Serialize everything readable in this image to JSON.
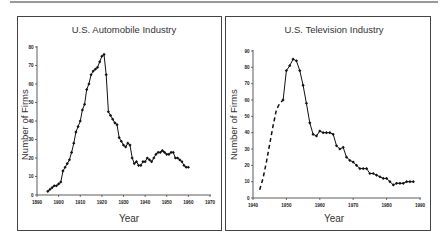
{
  "page": {
    "panels": [
      {
        "title": "U.S. Automobile Industry"
      },
      {
        "title": "U.S. Television Industry"
      }
    ]
  },
  "chart_data": [
    {
      "type": "line",
      "title": "U.S. Automobile Industry",
      "xlabel": "Year",
      "ylabel": "Number of Firms",
      "xlim": [
        1890,
        1970
      ],
      "ylim": [
        0,
        80
      ],
      "xticks": [
        1890,
        1900,
        1910,
        1920,
        1930,
        1940,
        1950,
        1960,
        1970
      ],
      "yticks": [
        0,
        10,
        20,
        30,
        40,
        50,
        60,
        70,
        80
      ],
      "grid": false,
      "legend": null,
      "series": [
        {
          "name": "Number of Firms",
          "style": "solid-with-markers",
          "x": [
            1895,
            1896,
            1897,
            1898,
            1899,
            1900,
            1901,
            1902,
            1903,
            1904,
            1905,
            1906,
            1907,
            1908,
            1909,
            1910,
            1911,
            1912,
            1913,
            1914,
            1915,
            1916,
            1917,
            1918,
            1919,
            1920,
            1921,
            1922,
            1923,
            1924,
            1925,
            1926,
            1927,
            1928,
            1929,
            1930,
            1931,
            1932,
            1933,
            1934,
            1935,
            1936,
            1937,
            1938,
            1939,
            1940,
            1941,
            1942,
            1943,
            1944,
            1945,
            1946,
            1947,
            1948,
            1949,
            1950,
            1951,
            1952,
            1953,
            1954,
            1955,
            1956,
            1957,
            1958,
            1959,
            1960
          ],
          "values": [
            2,
            3,
            4,
            5,
            5,
            6,
            7,
            13,
            15,
            17,
            19,
            23,
            28,
            34,
            37,
            40,
            46,
            49,
            57,
            60,
            65,
            67,
            68,
            69,
            72,
            75,
            76,
            65,
            45,
            43,
            41,
            39,
            38,
            31,
            29,
            27,
            26,
            28,
            27,
            20,
            17,
            18,
            16,
            16,
            18,
            18,
            20,
            19,
            18,
            20,
            22,
            23,
            23,
            24,
            23,
            22,
            22,
            23,
            23,
            20,
            20,
            19,
            18,
            16,
            15,
            15
          ]
        }
      ]
    },
    {
      "type": "line",
      "title": "U.S. Television Industry",
      "xlabel": "Year",
      "ylabel": "Number of Firms",
      "xlim": [
        1940,
        1990
      ],
      "ylim": [
        0,
        90
      ],
      "xticks": [
        1940,
        1950,
        1960,
        1970,
        1980,
        1990
      ],
      "yticks": [
        0,
        10,
        20,
        30,
        40,
        50,
        60,
        70,
        80,
        90
      ],
      "grid": false,
      "legend": null,
      "series": [
        {
          "name": "Estimated (dashed)",
          "style": "dashed",
          "x": [
            1942,
            1943,
            1944,
            1945,
            1946,
            1947,
            1948,
            1949
          ],
          "values": [
            5,
            12,
            22,
            33,
            44,
            54,
            58,
            60
          ]
        },
        {
          "name": "Number of Firms",
          "style": "solid-with-markers",
          "x": [
            1949,
            1950,
            1951,
            1952,
            1953,
            1954,
            1955,
            1956,
            1957,
            1958,
            1959,
            1960,
            1961,
            1962,
            1963,
            1964,
            1965,
            1966,
            1967,
            1968,
            1969,
            1970,
            1971,
            1972,
            1973,
            1974,
            1975,
            1976,
            1977,
            1978,
            1979,
            1980,
            1981,
            1982,
            1983,
            1984,
            1985,
            1986,
            1987,
            1988
          ],
          "values": [
            60,
            78,
            81,
            85,
            84,
            78,
            69,
            58,
            46,
            39,
            38,
            41,
            40,
            40,
            40,
            39,
            32,
            30,
            31,
            25,
            23,
            22,
            20,
            18,
            18,
            18,
            15,
            15,
            14,
            13,
            12,
            12,
            10,
            8,
            9,
            9,
            9,
            10,
            10,
            10
          ]
        }
      ]
    }
  ],
  "labels": {
    "auto_title": "U.S. Automobile Industry",
    "tv_title": "U.S. Television Industry",
    "xlabel": "Year",
    "ylabel": "Number of Firms"
  }
}
